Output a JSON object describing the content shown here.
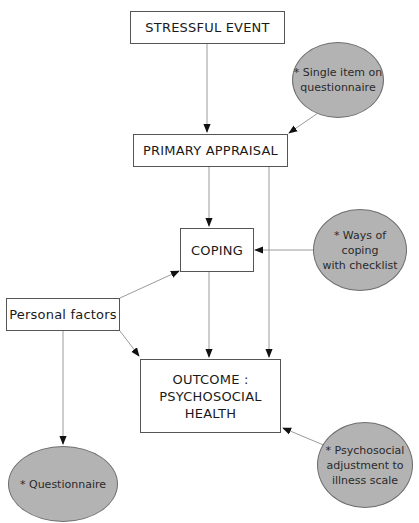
{
  "diagram": {
    "nodes": {
      "stressful_event": "STRESSFUL EVENT",
      "primary_appraisal": "PRIMARY APPRAISAL",
      "coping": "COPING",
      "personal_factors": "Personal factors",
      "outcome_line1": "OUTCOME :",
      "outcome_line2": "PSYCHOSOCIAL",
      "outcome_line3": "HEALTH"
    },
    "measures": {
      "single_item_line1": "* Single item on",
      "single_item_line2": "questionnaire",
      "ways_of_coping_line1": "* Ways of coping",
      "ways_of_coping_line2": "with checklist",
      "questionnaire": "* Questionnaire",
      "psychosocial_line1": "* Psychosocial",
      "psychosocial_line2": "adjustment to",
      "psychosocial_line3": "illness scale"
    },
    "colors": {
      "ellipse_fill": "#b3b3b3",
      "line": "#9a9a9a",
      "arrowhead": "#111111"
    }
  }
}
